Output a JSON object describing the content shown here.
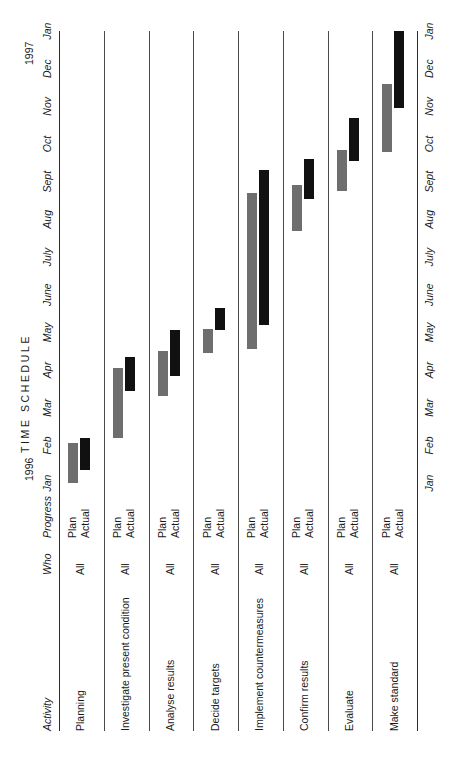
{
  "document": {
    "title": "TIME SCHEDULE",
    "orientation": "rotated-90-ccw"
  },
  "headers": {
    "activity": "Activity",
    "who": "Who",
    "progress": "Progress"
  },
  "years": {
    "start": "1996",
    "end": "1997"
  },
  "progress_labels": {
    "plan": "Plan",
    "actual": "Actual"
  },
  "colors": {
    "plan_bar": "#6e6e6e",
    "actual_bar": "#111111",
    "border": "#3a3a3a",
    "gridline": "#4a4a4a",
    "text": "#1a1a1a",
    "background": "#ffffff"
  },
  "chart_data": {
    "type": "bar",
    "title": "TIME SCHEDULE",
    "xlabel": "",
    "ylabel": "Activity",
    "categories": [
      "Planning",
      "Investigate present condition",
      "Analyse results",
      "Decide targets",
      "Implement countermeasures",
      "Confirm results",
      "Evaluate",
      "Make standard"
    ],
    "who": [
      "All",
      "All",
      "All",
      "All",
      "All",
      "All",
      "All",
      "All"
    ],
    "x_tick_labels": [
      "Jan",
      "Feb",
      "Mar",
      "Apr",
      "May",
      "June",
      "July",
      "Aug",
      "Sept",
      "Oct",
      "Nov",
      "Dec",
      "Jan"
    ],
    "x_axis_years": [
      "1996",
      "1997"
    ],
    "grid": true,
    "legend_position": "none",
    "series": [
      {
        "name": "Plan",
        "color": "#6e6e6e",
        "values": [
          {
            "activity": "Planning",
            "start_month": "Jan",
            "end_month": "Feb",
            "start_index": 0.0,
            "end_index": 1.05
          },
          {
            "activity": "Investigate present condition",
            "start_month": "Feb",
            "end_month": "Apr",
            "start_index": 1.2,
            "end_index": 3.05
          },
          {
            "activity": "Analyse results",
            "start_month": "Mar",
            "end_month": "Apr",
            "start_index": 2.3,
            "end_index": 3.5
          },
          {
            "activity": "Decide targets",
            "start_month": "Apr",
            "end_month": "May",
            "start_index": 3.45,
            "end_index": 4.1
          },
          {
            "activity": "Implement countermeasures",
            "start_month": "Apr",
            "end_month": "Aug",
            "start_index": 3.55,
            "end_index": 7.7
          },
          {
            "activity": "Confirm results",
            "start_month": "July",
            "end_month": "Aug",
            "start_index": 6.7,
            "end_index": 7.9
          },
          {
            "activity": "Evaluate",
            "start_month": "Aug",
            "end_month": "Sept",
            "start_index": 7.75,
            "end_index": 8.85
          },
          {
            "activity": "Make standard",
            "start_month": "Sept",
            "end_month": "Nov",
            "start_index": 8.8,
            "end_index": 10.6
          }
        ]
      },
      {
        "name": "Actual",
        "color": "#111111",
        "values": [
          {
            "activity": "Planning",
            "start_month": "Jan",
            "end_month": "Feb",
            "start_index": 0.35,
            "end_index": 1.2
          },
          {
            "activity": "Investigate present condition",
            "start_month": "Mar",
            "end_month": "Apr",
            "start_index": 2.45,
            "end_index": 3.35
          },
          {
            "activity": "Analyse results",
            "start_month": "Mar",
            "end_month": "May",
            "start_index": 2.85,
            "end_index": 4.05
          },
          {
            "activity": "Decide targets",
            "start_month": "May",
            "end_month": "May",
            "start_index": 4.05,
            "end_index": 4.65
          },
          {
            "activity": "Implement countermeasures",
            "start_month": "May",
            "end_month": "Sept",
            "start_index": 4.2,
            "end_index": 8.3
          },
          {
            "activity": "Confirm results",
            "start_month": "Aug",
            "end_month": "Sept",
            "start_index": 7.55,
            "end_index": 8.6
          },
          {
            "activity": "Evaluate",
            "start_month": "Sept",
            "end_month": "Oct",
            "start_index": 8.55,
            "end_index": 9.7
          },
          {
            "activity": "Make standard",
            "start_month": "Oct",
            "end_month": "Dec",
            "start_index": 9.95,
            "end_index": 12.0
          }
        ]
      }
    ]
  }
}
